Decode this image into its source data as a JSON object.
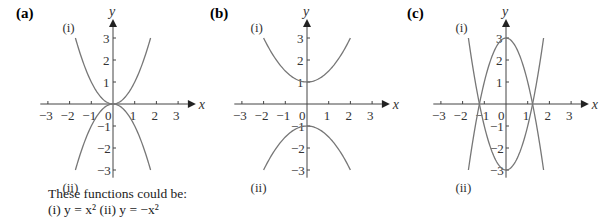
{
  "chart_data": [
    {
      "type": "line",
      "panel_label": "(a)",
      "xlabel": "x",
      "ylabel": "y",
      "xlim": [
        -3,
        3
      ],
      "ylim": [
        -3,
        3
      ],
      "x_ticks": [
        "-3",
        "-2",
        "-1",
        "0",
        "1",
        "2",
        "3"
      ],
      "y_ticks": [
        "3",
        "2",
        "1",
        "-1",
        "-2",
        "-3"
      ],
      "series": [
        {
          "name": "(i)",
          "function": "x^2",
          "a": 1,
          "c": 0
        },
        {
          "name": "(ii)",
          "function": "-x^2",
          "a": -1,
          "c": 0
        }
      ],
      "caption": [
        "These functions could be:",
        "(i) y = x² (ii) y = −x²"
      ]
    },
    {
      "type": "line",
      "panel_label": "(b)",
      "xlabel": "x",
      "ylabel": "y",
      "xlim": [
        -3,
        3
      ],
      "ylim": [
        -3,
        3
      ],
      "x_ticks": [
        "-3",
        "-2",
        "-1",
        "0",
        "1",
        "2",
        "3"
      ],
      "y_ticks": [
        "3",
        "2",
        "1",
        "-1",
        "-2",
        "-3"
      ],
      "series": [
        {
          "name": "(i)",
          "function": "0.5x^2+1",
          "a": 0.5,
          "c": 1
        },
        {
          "name": "(ii)",
          "function": "-0.5x^2-1",
          "a": -0.5,
          "c": -1
        }
      ]
    },
    {
      "type": "line",
      "panel_label": "(c)",
      "xlabel": "x",
      "ylabel": "y",
      "xlim": [
        -3,
        3
      ],
      "ylim": [
        -3,
        3
      ],
      "x_ticks": [
        "-3",
        "-2",
        "-1",
        "0",
        "1",
        "2",
        "3"
      ],
      "y_ticks": [
        "3",
        "2",
        "1",
        "-1",
        "-2",
        "-3"
      ],
      "series": [
        {
          "name": "(i)",
          "function": "2x^2-3",
          "a": 2,
          "c": -3
        },
        {
          "name": "(ii)",
          "function": "-2x^2+3",
          "a": -2,
          "c": 3
        }
      ]
    }
  ]
}
